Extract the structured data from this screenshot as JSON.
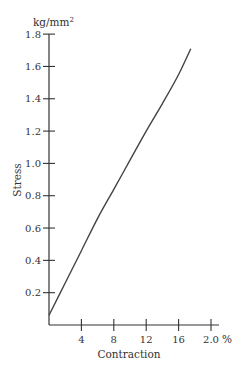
{
  "chart_data": {
    "type": "line",
    "title": "",
    "xlabel": "Contraction",
    "x_unit": "%",
    "ylabel": "Stress",
    "y_unit": "kg/mm²",
    "xlim": [
      0,
      20
    ],
    "ylim": [
      0,
      1.8
    ],
    "x_ticks": [
      4,
      8,
      12,
      16,
      20
    ],
    "x_tick_labels": [
      "4",
      "8",
      "12",
      "16",
      "2.0"
    ],
    "y_ticks": [
      0.2,
      0.4,
      0.6,
      0.8,
      1.0,
      1.2,
      1.4,
      1.6,
      1.8
    ],
    "y_tick_labels": [
      "0.2",
      "0.4",
      "0.6",
      "0.8",
      "1.0",
      "1.2",
      "1.4",
      "1.6",
      "1.8"
    ],
    "grid": false,
    "legend": null,
    "series": [
      {
        "name": "Stress vs Contraction",
        "x": [
          0,
          2,
          4,
          6,
          8,
          10,
          12,
          14,
          16,
          17.5
        ],
        "y": [
          0.06,
          0.26,
          0.46,
          0.66,
          0.84,
          1.02,
          1.2,
          1.37,
          1.55,
          1.71
        ]
      }
    ]
  }
}
